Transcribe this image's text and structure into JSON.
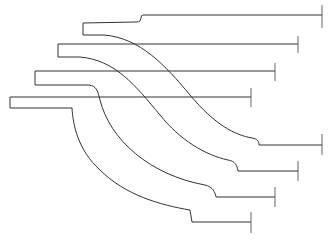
{
  "figure": {
    "type": "line-drawing",
    "colors": {
      "background": "#ffffff",
      "line": "#333333"
    },
    "profiles": [
      {
        "id": 1,
        "top_y": 15,
        "box_left_x": 83,
        "box_top_y": 23,
        "box_bottom_y": 35,
        "step_x": 141,
        "end_x": 322,
        "lower_y": 145,
        "lower_start_x": 262
      },
      {
        "id": 2,
        "top_y": 44,
        "box_left_x": 58,
        "box_top_y": 44,
        "box_bottom_y": 57,
        "step_x": 58,
        "end_x": 298,
        "lower_y": 171,
        "lower_start_x": 239
      },
      {
        "id": 3,
        "top_y": 71,
        "box_left_x": 35,
        "box_top_y": 71,
        "box_bottom_y": 85,
        "step_x": 35,
        "end_x": 275,
        "lower_y": 197,
        "lower_start_x": 216
      },
      {
        "id": 4,
        "top_y": 97,
        "box_left_x": 10,
        "box_top_y": 97,
        "box_bottom_y": 108,
        "step_x": 10,
        "end_x": 251,
        "lower_y": 222,
        "lower_start_x": 192
      }
    ]
  }
}
